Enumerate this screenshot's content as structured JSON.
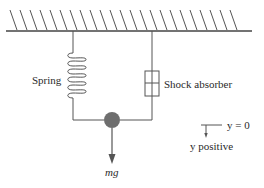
{
  "diagram": {
    "labels": {
      "spring": "Spring",
      "shock_absorber": "Shock absorber",
      "force": "mg",
      "reference": "y = 0",
      "direction": "y positive"
    },
    "colors": {
      "line": "#555555",
      "mass": "#6e6e6e",
      "text": "#2a2a2a"
    },
    "elements": {
      "ceiling": "hatched-ceiling",
      "spring": "coil-spring",
      "damper": "shock-absorber-box",
      "mass": "point-mass",
      "gravity_arrow": "downward-arrow",
      "axis_marker": "y-axis-reference"
    }
  }
}
